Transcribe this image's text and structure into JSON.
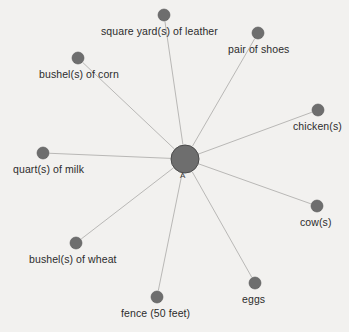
{
  "diagram": {
    "type": "radial-network",
    "background_color": "#f2f1ef",
    "node_color": "#6e6e6e",
    "edge_color": "#b9b8b6",
    "label_color": "#2c2c2c",
    "hub": {
      "label": "A",
      "x": 185,
      "y": 159,
      "radius": 14,
      "glyph_x": 180,
      "glyph_y": 172
    },
    "nodes": [
      {
        "id": "leather",
        "label": "square yard(s) of leather",
        "x": 164,
        "y": 15,
        "radius": 6,
        "label_x": 101,
        "label_y": 26
      },
      {
        "id": "shoes",
        "label": "pair of shoes",
        "x": 258,
        "y": 33,
        "radius": 6,
        "label_x": 228,
        "label_y": 44
      },
      {
        "id": "chicken",
        "label": "chicken(s)",
        "x": 318,
        "y": 110,
        "radius": 6,
        "label_x": 293,
        "label_y": 121
      },
      {
        "id": "cow",
        "label": "cow(s)",
        "x": 317,
        "y": 206,
        "radius": 6,
        "label_x": 300,
        "label_y": 217
      },
      {
        "id": "eggs",
        "label": "eggs",
        "x": 255,
        "y": 283,
        "radius": 6,
        "label_x": 242,
        "label_y": 294
      },
      {
        "id": "fence",
        "label": "fence (50 feet)",
        "x": 157,
        "y": 297,
        "radius": 6,
        "label_x": 121,
        "label_y": 308
      },
      {
        "id": "wheat",
        "label": "bushel(s) of wheat",
        "x": 76,
        "y": 243,
        "radius": 6,
        "label_x": 29,
        "label_y": 254
      },
      {
        "id": "milk",
        "label": "quart(s) of milk",
        "x": 43,
        "y": 153,
        "radius": 6,
        "label_x": 13,
        "label_y": 164
      },
      {
        "id": "corn",
        "label": "bushel(s) of corn",
        "x": 78,
        "y": 58,
        "radius": 6,
        "label_x": 39,
        "label_y": 69
      }
    ]
  }
}
